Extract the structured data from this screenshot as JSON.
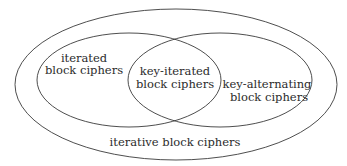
{
  "diagram": {
    "type": "venn",
    "sets": {
      "outer": {
        "label": "iterative block ciphers"
      },
      "left": {
        "label_line1": "iterated",
        "label_line2": "block ciphers"
      },
      "right": {
        "label_line1": "key-alternating",
        "label_line2": "block ciphers"
      },
      "intersection": {
        "label_line1": "key-iterated",
        "label_line2": "block ciphers"
      }
    },
    "relations": [
      "iterated block ciphers ⊂ iterative block ciphers",
      "key-alternating block ciphers ⊂ iterative block ciphers",
      "key-iterated block ciphers = iterated ∩ key-alternating"
    ]
  }
}
